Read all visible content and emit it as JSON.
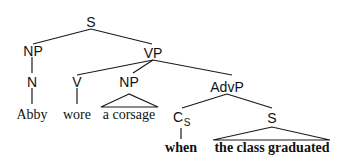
{
  "diagram": {
    "type": "syntax-tree",
    "nodes": {
      "root_s": {
        "label": "S"
      },
      "subject_np": {
        "label": "NP"
      },
      "vp": {
        "label": "VP"
      },
      "n": {
        "label": "N"
      },
      "v": {
        "label": "V"
      },
      "object_np": {
        "label": "NP"
      },
      "advp": {
        "label": "AdvP"
      },
      "cs": {
        "label": "C",
        "subscript": "S"
      },
      "embedded_s": {
        "label": "S"
      }
    },
    "leaves": {
      "abby": {
        "text": "Abby",
        "bold": false
      },
      "wore": {
        "text": "wore",
        "bold": false
      },
      "a_corsage": {
        "text": "a corsage",
        "bold": false,
        "triangle": true
      },
      "when": {
        "text": "when",
        "bold": true
      },
      "the_class_graduated": {
        "text": "the class graduated",
        "bold": true,
        "triangle": true
      }
    },
    "edges": [
      [
        "root_s",
        "subject_np"
      ],
      [
        "root_s",
        "vp"
      ],
      [
        "subject_np",
        "n"
      ],
      [
        "n",
        "abby"
      ],
      [
        "vp",
        "v"
      ],
      [
        "vp",
        "object_np"
      ],
      [
        "vp",
        "advp"
      ],
      [
        "v",
        "wore"
      ],
      [
        "object_np",
        "a_corsage"
      ],
      [
        "advp",
        "cs"
      ],
      [
        "advp",
        "embedded_s"
      ],
      [
        "cs",
        "when"
      ],
      [
        "embedded_s",
        "the_class_graduated"
      ]
    ]
  }
}
